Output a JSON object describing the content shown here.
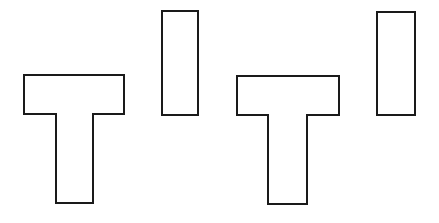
{
  "canvas": {
    "width": 439,
    "height": 223,
    "background": "#ffffff"
  },
  "style": {
    "stroke": "#1a1a1a",
    "stroke_width": 2,
    "fill": "#ffffff"
  },
  "figures": [
    {
      "id": "pair-left",
      "t_shape": {
        "points": "24,75 124,75 124,114 93,114 93,203 56,203 56,114 24,114"
      },
      "bar": {
        "x": 162,
        "y": 11,
        "width": 36,
        "height": 104
      }
    },
    {
      "id": "pair-right",
      "t_shape": {
        "points": "237,76 339,76 339,115 307,115 307,204 268,204 268,115 237,115"
      },
      "bar": {
        "x": 377,
        "y": 12,
        "width": 38,
        "height": 103
      }
    }
  ]
}
